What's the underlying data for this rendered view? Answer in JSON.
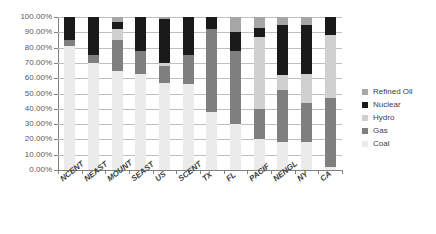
{
  "chart_data": {
    "type": "bar",
    "subtype": "stacked-100-percent",
    "title": "",
    "xlabel": "",
    "ylabel": "",
    "ylim": [
      0,
      100
    ],
    "ytick_labels": [
      "100.00%",
      "90.00%",
      "80.00%",
      "70.00%",
      "60.00%",
      "50.00%",
      "40.00%",
      "30.00%",
      "20.00%",
      "10.00%",
      "0.00%"
    ],
    "ytick_values": [
      100,
      90,
      80,
      70,
      60,
      50,
      40,
      30,
      20,
      10,
      0
    ],
    "grid": true,
    "legend_position": "right",
    "categories": [
      "NCENT",
      "NEAST",
      "MOUNT",
      "SEAST",
      "US",
      "SCENT",
      "TX",
      "FL",
      "PACIF",
      "NENGL",
      "NY",
      "CA"
    ],
    "series": [
      {
        "name": "Coal",
        "color": "#ebebeb",
        "values": [
          81,
          70,
          65,
          63,
          57,
          56,
          38,
          30,
          20,
          18,
          18,
          2
        ]
      },
      {
        "name": "Gas",
        "color": "#7f7f7f",
        "values": [
          4,
          5,
          20,
          15,
          11,
          19,
          54,
          48,
          20,
          34,
          26,
          45
        ]
      },
      {
        "name": "Hydro",
        "color": "#d0d0d0",
        "values": [
          0,
          0,
          7,
          0,
          2,
          0,
          0,
          0,
          47,
          10,
          19,
          41
        ]
      },
      {
        "name": "Nuclear",
        "color": "#1a1a1a",
        "values": [
          15,
          25,
          5,
          22,
          29,
          25,
          8,
          12,
          6,
          33,
          32,
          12
        ]
      },
      {
        "name": "Refined Oil",
        "color": "#a6a6a6",
        "values": [
          0,
          0,
          3,
          0,
          1,
          0,
          0,
          10,
          7,
          5,
          5,
          0
        ]
      }
    ],
    "legend_entries": [
      {
        "label": "Refined Oil",
        "color": "#a6a6a6"
      },
      {
        "label": "Nuclear",
        "color": "#1a1a1a"
      },
      {
        "label": "Hydro",
        "color": "#d0d0d0"
      },
      {
        "label": "Gas",
        "color": "#7f7f7f"
      },
      {
        "label": "Coal",
        "color": "#ebebeb"
      }
    ],
    "stack_order_bottom_to_top": [
      "Coal",
      "Gas",
      "Hydro",
      "Nuclear",
      "Refined Oil"
    ],
    "axis_color": "#808080",
    "grid_color": "#bfbfbf",
    "text_color": "#595959",
    "background": "#ffffff"
  }
}
